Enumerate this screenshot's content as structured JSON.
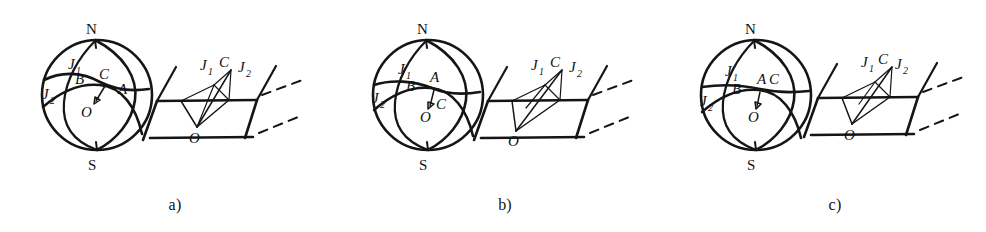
{
  "figure": {
    "background_color": "#ffffff",
    "ink_color": "#151515",
    "panel_count": 3
  },
  "panels": [
    {
      "id": "a",
      "caption": "a)",
      "sphere": {
        "pole_north": "N",
        "pole_south": "S",
        "center_label": "O",
        "labels": {
          "j1_base": "J",
          "j1_sub": "1",
          "j2_base": "J",
          "j2_sub": "2",
          "b": "B",
          "c": "C",
          "a": "A"
        },
        "label_order_note": "B then C then A, C above A"
      },
      "plane": {
        "labels": {
          "j1_base": "J",
          "j1_sub": "1",
          "c": "C",
          "j2_base": "J",
          "j2_sub": "2",
          "o": "O"
        }
      }
    },
    {
      "id": "b",
      "caption": "b)",
      "sphere": {
        "pole_north": "N",
        "pole_south": "S",
        "center_label": "O",
        "labels": {
          "j1_base": "J",
          "j1_sub": "1",
          "j2_base": "J",
          "j2_sub": "2",
          "b": "B",
          "c": "C",
          "a": "A"
        },
        "label_order_note": "A above intersection, C below right"
      },
      "plane": {
        "labels": {
          "j1_base": "J",
          "j1_sub": "1",
          "c": "C",
          "j2_base": "J",
          "j2_sub": "2",
          "o": "O"
        }
      }
    },
    {
      "id": "c",
      "caption": "c)",
      "sphere": {
        "pole_north": "N",
        "pole_south": "S",
        "center_label": "O",
        "labels": {
          "j1_base": "J",
          "j1_sub": "1",
          "j2_base": "J",
          "j2_sub": "2",
          "b": "B",
          "c": "C",
          "a": "A"
        },
        "label_order_note": "A and C side by side, coincident points"
      },
      "plane": {
        "labels": {
          "j1_base": "J",
          "j1_sub": "1",
          "c": "C",
          "j2_base": "J",
          "j2_sub": "2",
          "o": "O"
        }
      }
    }
  ]
}
